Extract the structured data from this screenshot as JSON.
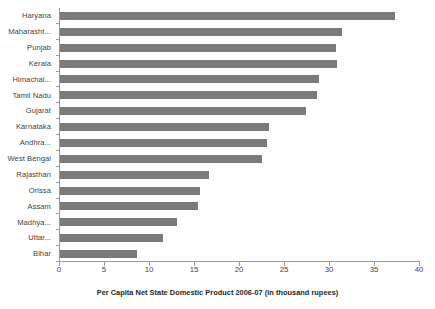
{
  "chart_data": {
    "type": "bar",
    "orientation": "horizontal",
    "title": "",
    "xlabel": "Per Capita Net State Domestic Product 2006-07 (in thousand rupees)",
    "ylabel": "",
    "xlim": [
      0,
      40
    ],
    "xticks": [
      0,
      5,
      10,
      15,
      20,
      25,
      30,
      35,
      40
    ],
    "grid": false,
    "legend": null,
    "bar_color": "#7a7a7a",
    "axis_color": "#9a9a9a",
    "categories": [
      "Haryana",
      "Maharasht...",
      "Punjab",
      "Kerala",
      "Himachal...",
      "Tamil Nadu",
      "Gujarat",
      "Karnataka",
      "Andhra...",
      "West Bengal",
      "Rajasthan",
      "Orissa",
      "Assam",
      "Madhya...",
      "Uttar...",
      "Bihar"
    ],
    "values": [
      37.2,
      31.3,
      30.7,
      30.8,
      28.8,
      28.5,
      27.3,
      23.2,
      23.0,
      22.4,
      16.6,
      15.6,
      15.3,
      13.0,
      11.4,
      8.5
    ],
    "series": [
      {
        "name": "Per Capita NSDP 2006-07",
        "values": [
          37.2,
          31.3,
          30.7,
          30.8,
          28.8,
          28.5,
          27.3,
          23.2,
          23.0,
          22.4,
          16.6,
          15.6,
          15.3,
          13.0,
          11.4,
          8.5
        ]
      }
    ]
  },
  "footer": {
    "clipped_text": ""
  }
}
